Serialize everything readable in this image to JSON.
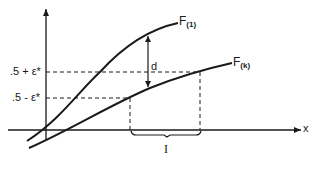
{
  "diagram": {
    "curves": [
      {
        "id": "F1",
        "label": "F",
        "subscript": "(1)"
      },
      {
        "id": "Fk",
        "label": "F",
        "subscript": "(k)"
      }
    ],
    "y_levels": {
      "upper": ".5 + ε*",
      "lower": ".5 - ε*"
    },
    "distance_label": "d",
    "interval_label": "I",
    "x_axis_label": "x",
    "colors": {
      "ink": "#1a1a1a",
      "background": "#ffffff"
    }
  }
}
